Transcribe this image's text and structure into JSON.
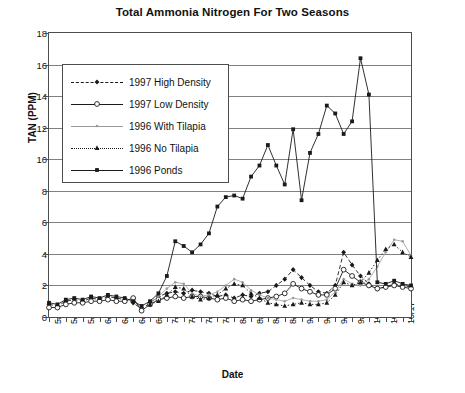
{
  "chart_data": {
    "type": "line",
    "title": "Total Ammonia Nitrogen For Two Seasons",
    "xlabel": "Date",
    "ylabel": "TAN (PPM)",
    "ylim": [
      0,
      18
    ],
    "ytick_step": 2,
    "yticks": [
      0,
      2,
      4,
      6,
      8,
      10,
      12,
      14,
      16,
      18
    ],
    "grid": "horizontal",
    "legend_position": "inside-upper-left",
    "categories": [
      "5/1",
      "5/16",
      "5/27",
      "6/3",
      "6/10",
      "6/17",
      "6/24",
      "7/4",
      "7/15",
      "7/22",
      "7/29",
      "8/8",
      "8/15",
      "8/22",
      "8/29",
      "9/5",
      "9/12",
      "9/19",
      "9/26",
      "10/3",
      "10/10",
      "10/17"
    ],
    "x_index_max": 43,
    "series": [
      {
        "name": "1997 High Density",
        "color": "#1a1a1a",
        "marker": "diamond",
        "line_style": "dashed",
        "points": [
          [
            0,
            0.8
          ],
          [
            1,
            0.7
          ],
          [
            2,
            1.0
          ],
          [
            3,
            1.1
          ],
          [
            4,
            1.0
          ],
          [
            5,
            1.2
          ],
          [
            6,
            1.1
          ],
          [
            7,
            1.3
          ],
          [
            8,
            1.2
          ],
          [
            9,
            1.1
          ],
          [
            10,
            0.9
          ],
          [
            11,
            0.5
          ],
          [
            12,
            0.9
          ],
          [
            13,
            1.3
          ],
          [
            14,
            1.5
          ],
          [
            15,
            1.6
          ],
          [
            16,
            1.5
          ],
          [
            17,
            1.7
          ],
          [
            18,
            1.6
          ],
          [
            19,
            1.5
          ],
          [
            20,
            1.3
          ],
          [
            21,
            1.4
          ],
          [
            22,
            1.2
          ],
          [
            23,
            1.4
          ],
          [
            24,
            1.3
          ],
          [
            25,
            1.5
          ],
          [
            26,
            1.6
          ],
          [
            27,
            2.0
          ],
          [
            28,
            2.4
          ],
          [
            29,
            3.0
          ],
          [
            30,
            2.5
          ],
          [
            31,
            2.0
          ],
          [
            32,
            1.6
          ],
          [
            33,
            1.5
          ],
          [
            34,
            2.0
          ],
          [
            35,
            4.1
          ],
          [
            36,
            3.3
          ],
          [
            37,
            2.6
          ],
          [
            38,
            2.1
          ],
          [
            39,
            1.8
          ],
          [
            40,
            1.9
          ],
          [
            41,
            2.1
          ],
          [
            42,
            2.0
          ],
          [
            43,
            1.9
          ]
        ]
      },
      {
        "name": "1997 Low Density",
        "color": "#1a1a1a",
        "marker": "circle-open",
        "line_style": "solid",
        "points": [
          [
            0,
            0.6
          ],
          [
            1,
            0.6
          ],
          [
            2,
            0.8
          ],
          [
            3,
            0.9
          ],
          [
            4,
            0.9
          ],
          [
            5,
            1.0
          ],
          [
            6,
            1.0
          ],
          [
            7,
            1.1
          ],
          [
            8,
            1.0
          ],
          [
            9,
            1.0
          ],
          [
            10,
            1.2
          ],
          [
            11,
            0.4
          ],
          [
            12,
            0.8
          ],
          [
            13,
            1.1
          ],
          [
            14,
            1.2
          ],
          [
            15,
            1.3
          ],
          [
            16,
            1.2
          ],
          [
            17,
            1.3
          ],
          [
            18,
            1.3
          ],
          [
            19,
            1.2
          ],
          [
            20,
            1.1
          ],
          [
            21,
            1.2
          ],
          [
            22,
            1.0
          ],
          [
            23,
            1.1
          ],
          [
            24,
            1.0
          ],
          [
            25,
            1.1
          ],
          [
            26,
            1.2
          ],
          [
            27,
            1.3
          ],
          [
            28,
            1.5
          ],
          [
            29,
            2.1
          ],
          [
            30,
            1.8
          ],
          [
            31,
            1.6
          ],
          [
            32,
            1.4
          ],
          [
            33,
            1.4
          ],
          [
            34,
            1.8
          ],
          [
            35,
            3.0
          ],
          [
            36,
            2.6
          ],
          [
            37,
            2.2
          ],
          [
            38,
            2.0
          ],
          [
            39,
            1.8
          ],
          [
            40,
            1.9
          ],
          [
            41,
            2.0
          ],
          [
            42,
            1.9
          ],
          [
            43,
            1.8
          ]
        ]
      },
      {
        "name": "1996 With Tilapia",
        "color": "#9a9a9a",
        "marker": "star-small",
        "line_style": "solid",
        "points": [
          [
            12,
            0.9
          ],
          [
            13,
            1.3
          ],
          [
            14,
            1.8
          ],
          [
            15,
            2.2
          ],
          [
            16,
            2.1
          ],
          [
            17,
            1.5
          ],
          [
            18,
            1.3
          ],
          [
            19,
            1.4
          ],
          [
            20,
            1.6
          ],
          [
            21,
            2.0
          ],
          [
            22,
            2.4
          ],
          [
            23,
            2.2
          ],
          [
            24,
            1.7
          ],
          [
            25,
            1.4
          ],
          [
            26,
            1.2
          ],
          [
            27,
            1.1
          ],
          [
            28,
            1.0
          ],
          [
            29,
            1.2
          ],
          [
            30,
            1.1
          ],
          [
            31,
            1.0
          ],
          [
            32,
            1.0
          ],
          [
            33,
            1.1
          ],
          [
            34,
            1.6
          ],
          [
            35,
            2.4
          ],
          [
            36,
            2.1
          ],
          [
            37,
            2.0
          ],
          [
            38,
            2.4
          ],
          [
            39,
            3.2
          ],
          [
            40,
            4.1
          ],
          [
            41,
            4.9
          ],
          [
            42,
            4.8
          ],
          [
            43,
            3.9
          ]
        ]
      },
      {
        "name": "1996 No Tilapia",
        "color": "#1a1a1a",
        "marker": "triangle",
        "line_style": "dotted",
        "points": [
          [
            12,
            0.8
          ],
          [
            13,
            1.0
          ],
          [
            14,
            1.4
          ],
          [
            15,
            1.9
          ],
          [
            16,
            1.8
          ],
          [
            17,
            1.3
          ],
          [
            18,
            1.1
          ],
          [
            19,
            1.2
          ],
          [
            20,
            1.4
          ],
          [
            21,
            1.8
          ],
          [
            22,
            2.1
          ],
          [
            23,
            2.0
          ],
          [
            24,
            1.5
          ],
          [
            25,
            1.2
          ],
          [
            26,
            0.9
          ],
          [
            27,
            0.8
          ],
          [
            28,
            0.7
          ],
          [
            29,
            0.8
          ],
          [
            30,
            0.9
          ],
          [
            31,
            0.8
          ],
          [
            32,
            0.8
          ],
          [
            33,
            0.9
          ],
          [
            34,
            1.4
          ],
          [
            35,
            2.2
          ],
          [
            36,
            2.0
          ],
          [
            37,
            2.2
          ],
          [
            38,
            2.8
          ],
          [
            39,
            3.6
          ],
          [
            40,
            4.3
          ],
          [
            41,
            4.6
          ],
          [
            42,
            4.1
          ],
          [
            43,
            3.8
          ]
        ]
      },
      {
        "name": "1996 Ponds",
        "color": "#1a1a1a",
        "marker": "square",
        "line_style": "solid",
        "points": [
          [
            0,
            0.9
          ],
          [
            1,
            0.8
          ],
          [
            2,
            1.1
          ],
          [
            3,
            1.2
          ],
          [
            4,
            1.1
          ],
          [
            5,
            1.3
          ],
          [
            6,
            1.2
          ],
          [
            7,
            1.4
          ],
          [
            8,
            1.3
          ],
          [
            9,
            1.2
          ],
          [
            10,
            1.0
          ],
          [
            11,
            0.7
          ],
          [
            12,
            1.0
          ],
          [
            13,
            1.5
          ],
          [
            14,
            2.6
          ],
          [
            15,
            4.8
          ],
          [
            16,
            4.5
          ],
          [
            17,
            4.1
          ],
          [
            18,
            4.6
          ],
          [
            19,
            5.3
          ],
          [
            20,
            7.0
          ],
          [
            21,
            7.6
          ],
          [
            22,
            7.7
          ],
          [
            23,
            7.5
          ],
          [
            24,
            8.9
          ],
          [
            25,
            9.6
          ],
          [
            26,
            10.9
          ],
          [
            27,
            9.6
          ],
          [
            28,
            8.4
          ],
          [
            29,
            11.9
          ],
          [
            30,
            7.4
          ],
          [
            31,
            10.4
          ],
          [
            32,
            11.6
          ],
          [
            33,
            13.4
          ],
          [
            34,
            12.9
          ],
          [
            35,
            11.6
          ],
          [
            36,
            12.4
          ],
          [
            37,
            16.4
          ],
          [
            38,
            14.1
          ],
          [
            39,
            2.2
          ],
          [
            40,
            2.1
          ],
          [
            41,
            2.3
          ],
          [
            42,
            2.1
          ],
          [
            43,
            2.0
          ]
        ]
      }
    ]
  }
}
